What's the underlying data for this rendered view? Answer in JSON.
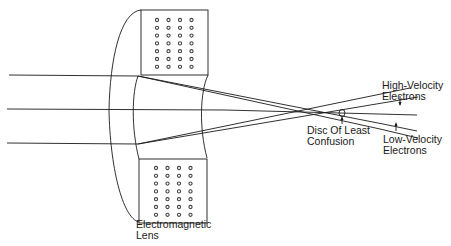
{
  "diagram": {
    "labels": {
      "lens": [
        "Electromagnetic",
        "Lens"
      ],
      "high_velocity": [
        "High-Velocity",
        "Electrons"
      ],
      "low_velocity": [
        "Low-Velocity",
        "Electrons"
      ],
      "disc": [
        "Disc Of Least",
        "Confusion"
      ]
    },
    "colors": {
      "line": "#1a1a1a",
      "background": "#ffffff",
      "coil_dot": "#555555"
    },
    "coil_grid": {
      "rows": 7,
      "cols": 4
    }
  }
}
